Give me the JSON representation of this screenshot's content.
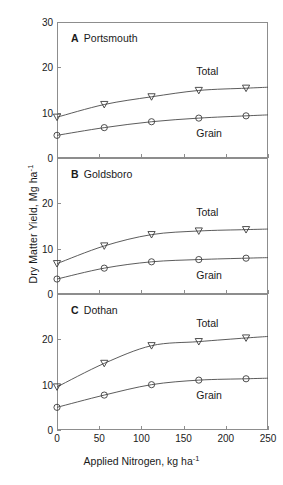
{
  "chart_data": {
    "type": "line",
    "title": "",
    "xlabel": "Applied Nitrogen, kg ha-1",
    "ylabel": "Dry Matter Yield, Mg ha-1",
    "x": [
      0,
      56,
      112,
      168,
      224
    ],
    "xlim": [
      0,
      250
    ],
    "xticks": [
      0,
      50,
      100,
      150,
      200,
      250
    ],
    "grid": false,
    "legend_position": "inline-annotation",
    "panels": [
      {
        "id": "A",
        "letter": "A",
        "name": "Portsmouth",
        "ylim": [
          0,
          30
        ],
        "yticks": [
          0,
          10,
          20,
          30
        ],
        "series": [
          {
            "name": "Total",
            "marker": "open-triangle-down",
            "values": [
              9.0,
              11.8,
              13.5,
              14.9,
              15.4
            ]
          },
          {
            "name": "Grain",
            "marker": "open-circle",
            "values": [
              5.0,
              6.7,
              8.0,
              8.8,
              9.3
            ]
          }
        ]
      },
      {
        "id": "B",
        "letter": "B",
        "name": "Goldsboro",
        "ylim": [
          0,
          30
        ],
        "yticks": [
          0,
          10,
          20
        ],
        "series": [
          {
            "name": "Total",
            "marker": "open-triangle-down",
            "values": [
              6.7,
              10.6,
              13.1,
              13.9,
              14.2
            ]
          },
          {
            "name": "Grain",
            "marker": "open-circle",
            "values": [
              3.3,
              5.7,
              7.1,
              7.6,
              7.9
            ]
          }
        ]
      },
      {
        "id": "C",
        "letter": "C",
        "name": "Dothan",
        "ylim": [
          0,
          30
        ],
        "yticks": [
          0,
          10,
          20
        ],
        "series": [
          {
            "name": "Total",
            "marker": "open-triangle-down",
            "values": [
              9.5,
              14.7,
              18.6,
              19.5,
              20.3
            ]
          },
          {
            "name": "Grain",
            "marker": "open-circle",
            "values": [
              5.0,
              7.7,
              10.0,
              11.0,
              11.3
            ]
          }
        ]
      }
    ]
  },
  "axes": {
    "x_label_text": "Applied Nitrogen, kg ha",
    "x_label_sup": "-1",
    "y_label_text": "Dry Matter Yield, Mg ha",
    "y_label_sup": "-1"
  },
  "colors": {
    "axis": "#8d8d8d",
    "curve": "#4a4a4a",
    "marker": "#3c3c3c",
    "text": "#1a1a1a",
    "background": "#ffffff"
  }
}
